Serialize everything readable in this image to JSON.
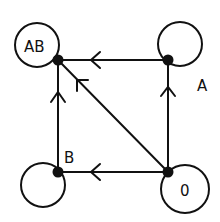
{
  "diagram": {
    "type": "directed-graph",
    "stroke_color": "#111111",
    "background": "#ffffff",
    "nodes": [
      {
        "id": "AB",
        "label": "AB",
        "x": 58,
        "y": 60,
        "loop": {
          "cx": 37,
          "cy": 45,
          "r": 22
        },
        "label_x": 24,
        "label_y": 52
      },
      {
        "id": "A",
        "label": "A",
        "x": 168,
        "y": 60,
        "loop": {
          "cx": 180,
          "cy": 44,
          "r": 22
        },
        "label_x": 198,
        "label_y": 91
      },
      {
        "id": "B",
        "label": "B",
        "x": 58,
        "y": 172,
        "loop": {
          "cx": 43,
          "cy": 185,
          "r": 22
        },
        "label_x": 65,
        "label_y": 163
      },
      {
        "id": "O",
        "label": "0",
        "x": 168,
        "y": 172,
        "loop": {
          "cx": 185,
          "cy": 189,
          "r": 24
        },
        "label_x": 181,
        "label_y": 196
      }
    ],
    "edges": [
      {
        "from": "A",
        "to": "AB",
        "arrow_at": [
          92,
          60
        ],
        "direction": "left"
      },
      {
        "from": "O",
        "to": "A",
        "arrow_at": [
          168,
          88
        ],
        "direction": "up"
      },
      {
        "from": "O",
        "to": "B",
        "arrow_at": [
          92,
          172
        ],
        "direction": "left"
      },
      {
        "from": "B",
        "to": "AB",
        "arrow_at": [
          58,
          93
        ],
        "direction": "up"
      },
      {
        "from": "O",
        "to": "AB",
        "arrow_at": [
          77,
          80
        ],
        "direction": "up-left"
      }
    ],
    "self_loops": [
      "AB",
      "A",
      "B",
      "O"
    ]
  }
}
